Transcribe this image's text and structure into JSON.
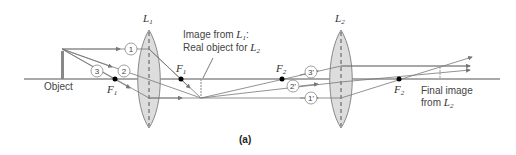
{
  "diagram": {
    "caption": "(a)",
    "object_label": "Object",
    "lens1": {
      "name": "L",
      "sub": "1"
    },
    "lens2": {
      "name": "L",
      "sub": "2"
    },
    "focal_points": [
      {
        "name": "F",
        "sub": "1",
        "position": "left of L1"
      },
      {
        "name": "F",
        "sub": "1",
        "position": "right of L1"
      },
      {
        "name": "F",
        "sub": "2",
        "position": "left of L2"
      },
      {
        "name": "F",
        "sub": "2",
        "position": "right of L2"
      }
    ],
    "intermediate_image_label": {
      "line1_prefix": "Image from ",
      "line1_lens": "L",
      "line1_sub": "1",
      "line1_suffix": ":",
      "line2_prefix": "Real object for ",
      "line2_lens": "L",
      "line2_sub": "2"
    },
    "final_image_label": {
      "line1": "Final image",
      "line2_prefix": "from ",
      "line2_lens": "L",
      "line2_sub": "2"
    },
    "ray_labels_l1": [
      "1",
      "2",
      "3"
    ],
    "ray_labels_l2": [
      "3'",
      "2'",
      "1'"
    ],
    "colors": {
      "axis": "#555555",
      "ray": "#777777",
      "lens_fill": "#dddddd",
      "lens_stroke": "#888888",
      "focal_dot": "#000000",
      "object": "#888888"
    }
  }
}
